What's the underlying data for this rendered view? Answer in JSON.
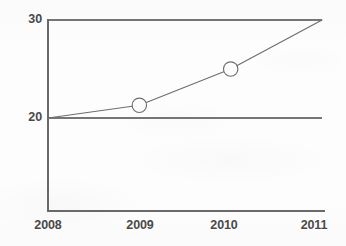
{
  "chart_data": {
    "type": "line",
    "title": "",
    "subtitle": "",
    "xlabel": "",
    "ylabel": "",
    "x": [
      2008,
      2009,
      2010,
      2011
    ],
    "categories": [
      "2008",
      "2009",
      "2010",
      "2011"
    ],
    "values": [
      20,
      21.3,
      25,
      30
    ],
    "series": [
      {
        "name": "",
        "values": [
          20,
          21.3,
          25,
          30
        ],
        "marker": "open-circle",
        "marker_at": [
          false,
          true,
          true,
          false
        ],
        "color": "#6e6e6e",
        "line_width": 1
      }
    ],
    "xlim": [
      2008,
      2011
    ],
    "ylim": [
      20,
      30
    ],
    "x_tick_labels": [
      "2008",
      "2009",
      "2010",
      "2011"
    ],
    "y_tick_labels": [
      "20",
      "30"
    ],
    "y_tick_values": [
      20,
      30
    ],
    "grid": true,
    "grid_axis": "y",
    "legend": false,
    "legend_position": "none",
    "annotations": []
  },
  "axes": {
    "y_ticks": [
      {
        "label": "30",
        "value": 30
      },
      {
        "label": "20",
        "value": 20
      }
    ],
    "x_ticks": [
      {
        "label": "2008",
        "value": 2008
      },
      {
        "label": "2009",
        "value": 2009
      },
      {
        "label": "2010",
        "value": 2010
      },
      {
        "label": "2011",
        "value": 2011
      }
    ]
  },
  "colors": {
    "background": "#fdfdfd",
    "axis_line": "#6a6a6a",
    "grid_line": "#767676",
    "data_line": "#6e6e6e",
    "marker_stroke": "#6e6e6e",
    "marker_fill": "#fdfdfd",
    "tick_label": "#4a4a4a"
  }
}
